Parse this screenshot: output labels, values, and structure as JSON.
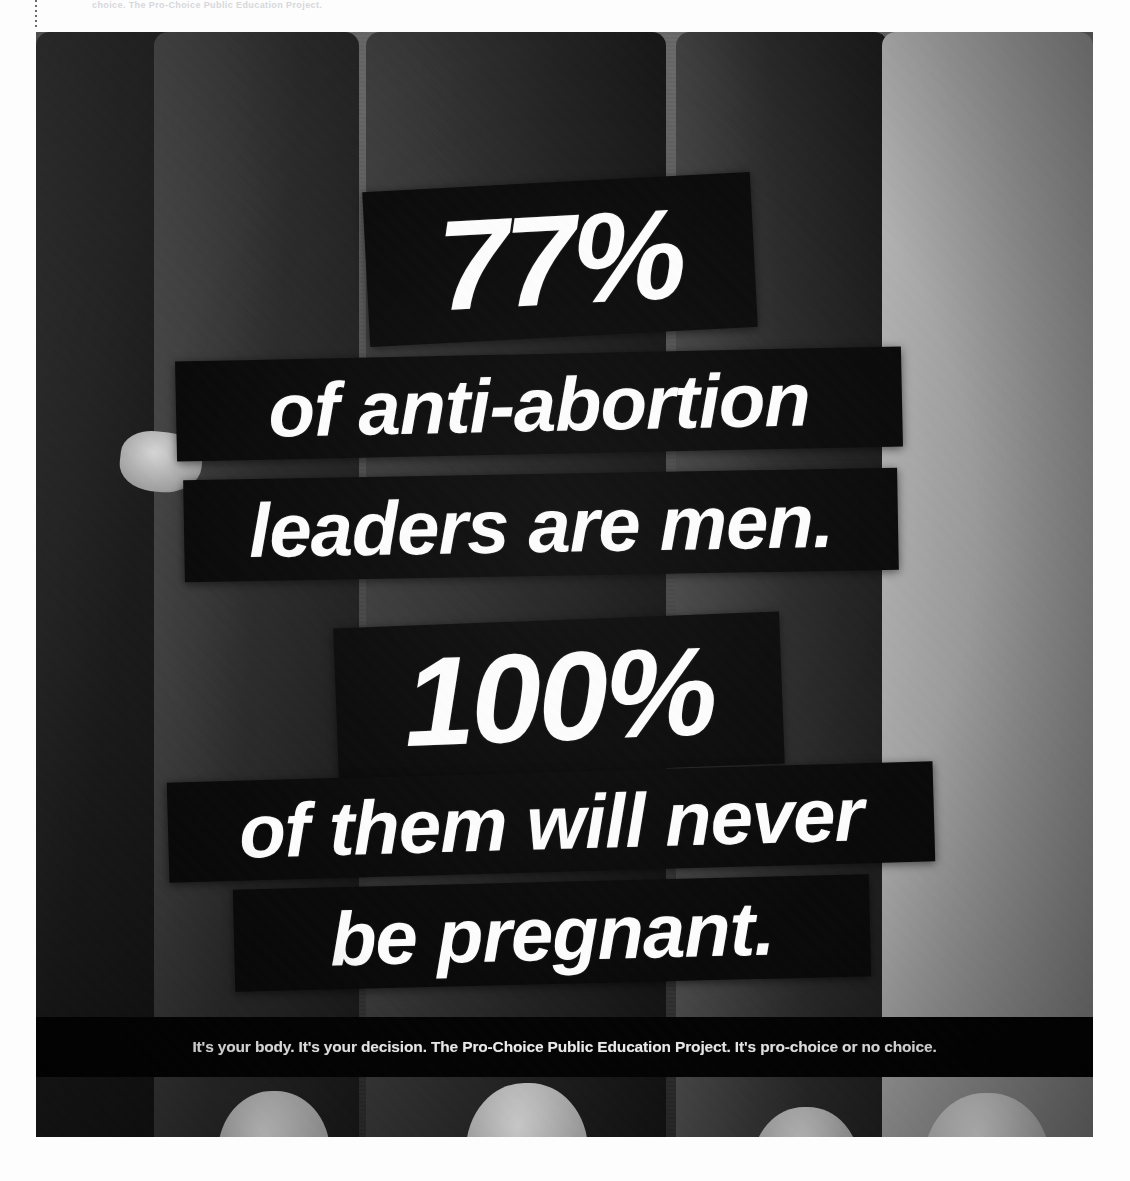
{
  "page": {
    "background_color": "#ffffff",
    "scan_header_text": "choice. The Pro-Choice Public Education Project."
  },
  "photo": {
    "title": "anti-abortion-leaders-poster-photograph",
    "palette": {
      "banner_black": "#0b0b0b",
      "text_white": "#fbfbf8",
      "caption_black": "#050505",
      "backdrop_gray": "#4a4a4a"
    }
  },
  "poster": {
    "headline_lines": [
      {
        "id": "stat-77",
        "text": "77%",
        "emphasis": "statistic"
      },
      {
        "id": "line-anti",
        "text": "of anti-abortion",
        "emphasis": "body"
      },
      {
        "id": "line-leaders",
        "text": "leaders are men.",
        "emphasis": "body"
      },
      {
        "id": "stat-100",
        "text": "100%",
        "emphasis": "statistic"
      },
      {
        "id": "line-them",
        "text": "of them will never",
        "emphasis": "body"
      },
      {
        "id": "line-pregnant",
        "text": "be pregnant.",
        "emphasis": "body"
      }
    ],
    "caption": "It's your body. It's your decision. The Pro-Choice Public Education Project. It's pro-choice or no choice.",
    "organization": "The Pro-Choice Public Education Project",
    "tagline": "It's pro-choice or no choice."
  },
  "stats": {
    "anti_abortion_leaders_male_percent": "77%",
    "never_pregnant_percent": "100%"
  }
}
